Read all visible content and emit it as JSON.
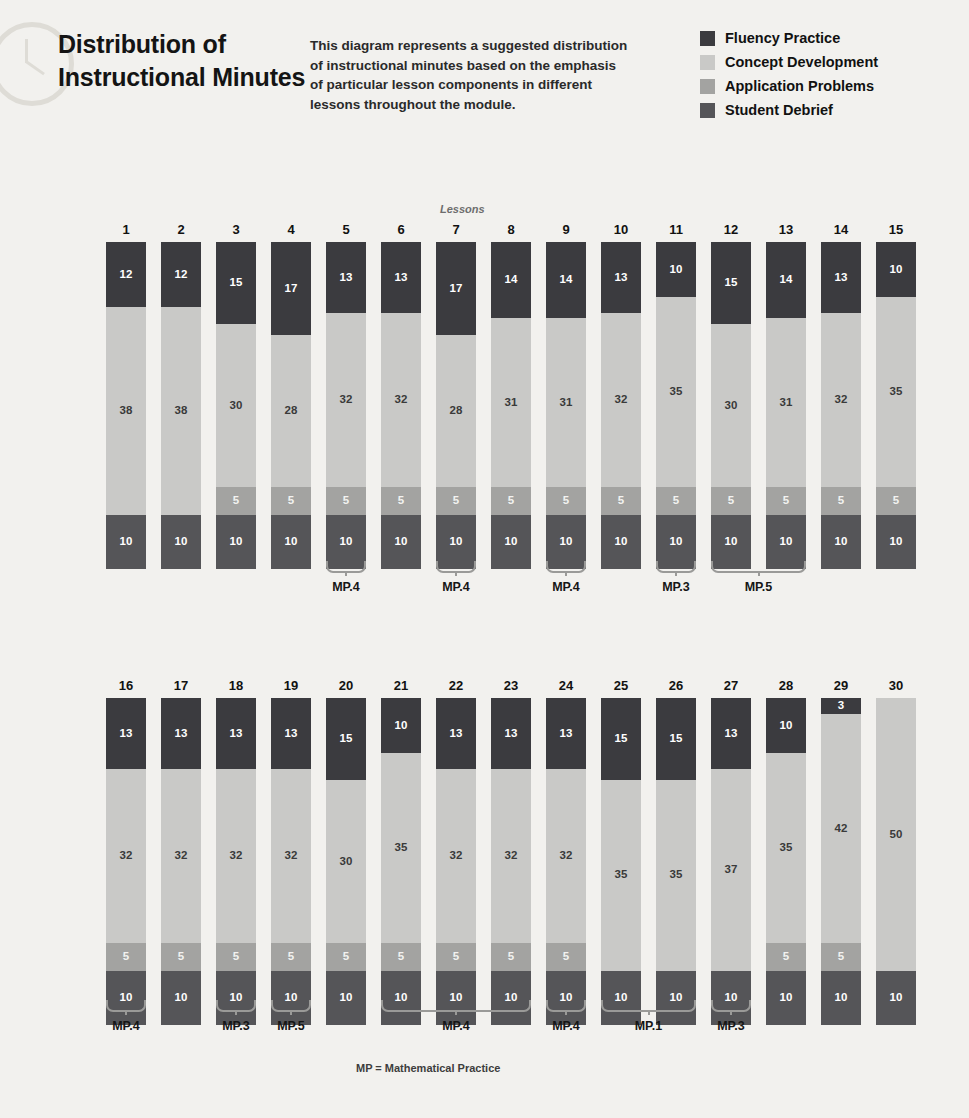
{
  "header": {
    "title": "Distribution of Instructional Minutes",
    "description": "This diagram represents a suggested distribution of instructional minutes based on the emphasis of particular lesson components in different lessons throughout the module."
  },
  "legend": {
    "items": [
      {
        "label": "Fluency Practice",
        "color": "#3b3b3f"
      },
      {
        "label": "Concept Development",
        "color": "#c9c9c7"
      },
      {
        "label": "Application Problems",
        "color": "#a3a3a1"
      },
      {
        "label": "Student Debrief",
        "color": "#555558"
      }
    ]
  },
  "axis_caption": "Lessons",
  "footnote": "MP = Mathematical Practice",
  "chart_data": {
    "type": "bar",
    "title": "Distribution of Instructional Minutes",
    "subtype": "stacked-vertical",
    "xlabel": "Lessons",
    "ylabel": "Instructional minutes",
    "ylim": [
      0,
      60
    ],
    "grid": false,
    "legend_position": "top-right",
    "series_order": [
      "Fluency Practice",
      "Concept Development",
      "Application Problems",
      "Student Debrief"
    ],
    "series_colors": {
      "Fluency Practice": "#3b3b3f",
      "Concept Development": "#c9c9c7",
      "Application Problems": "#a3a3a1",
      "Student Debrief": "#555558"
    },
    "categories": [
      1,
      2,
      3,
      4,
      5,
      6,
      7,
      8,
      9,
      10,
      11,
      12,
      13,
      14,
      15,
      16,
      17,
      18,
      19,
      20,
      21,
      22,
      23,
      24,
      25,
      26,
      27,
      28,
      29,
      30
    ],
    "series": [
      {
        "name": "Fluency Practice",
        "values": [
          12,
          12,
          15,
          17,
          13,
          13,
          17,
          14,
          14,
          13,
          10,
          15,
          14,
          13,
          10,
          13,
          13,
          13,
          13,
          15,
          10,
          13,
          13,
          13,
          15,
          15,
          13,
          10,
          3,
          0
        ]
      },
      {
        "name": "Concept Development",
        "values": [
          38,
          38,
          30,
          28,
          32,
          32,
          28,
          31,
          31,
          32,
          35,
          30,
          31,
          32,
          35,
          32,
          32,
          32,
          32,
          30,
          35,
          32,
          32,
          32,
          35,
          35,
          37,
          35,
          42,
          50
        ]
      },
      {
        "name": "Application Problems",
        "values": [
          0,
          0,
          5,
          5,
          5,
          5,
          5,
          5,
          5,
          5,
          5,
          5,
          5,
          5,
          5,
          5,
          5,
          5,
          5,
          5,
          5,
          5,
          5,
          5,
          0,
          0,
          0,
          5,
          5,
          0
        ]
      },
      {
        "name": "Student Debrief",
        "values": [
          10,
          10,
          10,
          10,
          10,
          10,
          10,
          10,
          10,
          10,
          10,
          10,
          10,
          10,
          10,
          10,
          10,
          10,
          10,
          10,
          10,
          10,
          10,
          10,
          10,
          10,
          10,
          10,
          10,
          10
        ]
      }
    ],
    "annotations": [
      {
        "label": "MP.4",
        "lessons": [
          5
        ]
      },
      {
        "label": "MP.4",
        "lessons": [
          7
        ]
      },
      {
        "label": "MP.4",
        "lessons": [
          9
        ]
      },
      {
        "label": "MP.3",
        "lessons": [
          11
        ]
      },
      {
        "label": "MP.5",
        "lessons": [
          12,
          13
        ]
      },
      {
        "label": "MP.4",
        "lessons": [
          16
        ]
      },
      {
        "label": "MP.3",
        "lessons": [
          18
        ]
      },
      {
        "label": "MP.5",
        "lessons": [
          19
        ]
      },
      {
        "label": "MP.4",
        "lessons": [
          21,
          22,
          23
        ]
      },
      {
        "label": "MP.4",
        "lessons": [
          24
        ]
      },
      {
        "label": "MP.1",
        "lessons": [
          25,
          26
        ]
      },
      {
        "label": "MP.3",
        "lessons": [
          27
        ]
      }
    ]
  },
  "rows": [
    {
      "name": "row-1",
      "first": 1,
      "last": 15
    },
    {
      "name": "row-2",
      "first": 16,
      "last": 30
    }
  ]
}
